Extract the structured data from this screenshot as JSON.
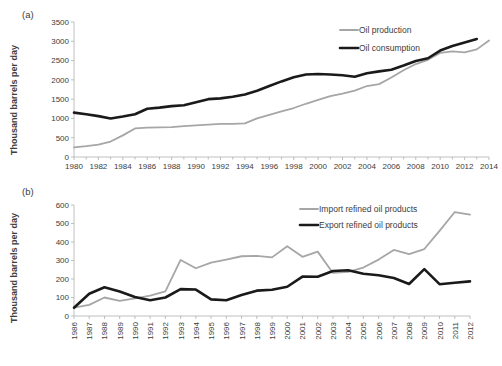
{
  "figure": {
    "panels": [
      {
        "id": "a",
        "label": "(a)",
        "ylabel": "Thousand barrels per day"
      },
      {
        "id": "b",
        "label": "(b)",
        "ylabel": "Thousand barrels per day"
      }
    ]
  },
  "chart_data": [
    {
      "type": "line",
      "panel": "(a)",
      "title": "",
      "xlabel": "",
      "ylabel": "Thousand barrels per day",
      "xlim": [
        1980,
        2014
      ],
      "ylim": [
        0,
        3500
      ],
      "yticks": [
        0,
        500,
        1000,
        1500,
        2000,
        2500,
        3000,
        3500
      ],
      "xticks": [
        1980,
        1982,
        1984,
        1986,
        1988,
        1990,
        1992,
        1994,
        1996,
        1998,
        2000,
        2002,
        2004,
        2006,
        2008,
        2010,
        2012,
        2014
      ],
      "grid": false,
      "legend_position": "top-right",
      "x": [
        1980,
        1981,
        1982,
        1983,
        1984,
        1985,
        1986,
        1987,
        1988,
        1989,
        1990,
        1991,
        1992,
        1993,
        1994,
        1995,
        1996,
        1997,
        1998,
        1999,
        2000,
        2001,
        2002,
        2003,
        2004,
        2005,
        2006,
        2007,
        2008,
        2009,
        2010,
        2011,
        2012,
        2013,
        2014
      ],
      "series": [
        {
          "name": "Oil production",
          "color": "#a6a6a6",
          "width": 1.8,
          "values": [
            250,
            280,
            320,
            400,
            560,
            740,
            760,
            770,
            775,
            800,
            820,
            840,
            860,
            860,
            870,
            1000,
            1090,
            1180,
            1270,
            1380,
            1480,
            1580,
            1640,
            1720,
            1840,
            1890,
            2060,
            2250,
            2410,
            2520,
            2700,
            2740,
            2710,
            2790,
            3020
          ]
        },
        {
          "name": "Oil consumption",
          "color": "#1a1a1a",
          "width": 2.6,
          "values": [
            1150,
            1110,
            1060,
            1000,
            1050,
            1110,
            1250,
            1280,
            1320,
            1340,
            1420,
            1500,
            1520,
            1560,
            1620,
            1720,
            1840,
            1960,
            2070,
            2140,
            2150,
            2140,
            2120,
            2080,
            2170,
            2220,
            2260,
            2370,
            2490,
            2560,
            2760,
            2880,
            2970,
            3060
          ]
        }
      ]
    },
    {
      "type": "line",
      "panel": "(b)",
      "title": "",
      "xlabel": "",
      "ylabel": "Thousand barrels per day",
      "xlim": [
        1986,
        2012
      ],
      "ylim": [
        0,
        600
      ],
      "yticks": [
        0,
        100,
        200,
        300,
        400,
        500,
        600
      ],
      "xticks": [
        1986,
        1987,
        1988,
        1989,
        1990,
        1991,
        1992,
        1993,
        1994,
        1995,
        1996,
        1997,
        1998,
        1999,
        2000,
        2001,
        2002,
        2003,
        2004,
        2005,
        2006,
        2007,
        2008,
        2009,
        2010,
        2011,
        2012
      ],
      "grid": false,
      "legend_position": "top-right",
      "x": [
        1986,
        1987,
        1988,
        1989,
        1990,
        1991,
        1992,
        1993,
        1994,
        1995,
        1996,
        1997,
        1998,
        1999,
        2000,
        2001,
        2002,
        2003,
        2004,
        2005,
        2006,
        2007,
        2008,
        2009,
        2010,
        2011,
        2012
      ],
      "series": [
        {
          "name": "Import refined oil products",
          "color": "#a6a6a6",
          "width": 1.8,
          "values": [
            45,
            60,
            100,
            82,
            95,
            110,
            133,
            303,
            258,
            288,
            305,
            323,
            325,
            317,
            377,
            320,
            348,
            233,
            238,
            262,
            305,
            357,
            335,
            362,
            460,
            562,
            548
          ]
        },
        {
          "name": "Export refined oil products",
          "color": "#1a1a1a",
          "width": 2.6,
          "values": [
            45,
            120,
            155,
            132,
            103,
            85,
            100,
            145,
            143,
            90,
            85,
            113,
            137,
            142,
            158,
            213,
            212,
            243,
            247,
            228,
            220,
            205,
            173,
            253,
            172,
            180,
            187
          ]
        }
      ]
    }
  ]
}
